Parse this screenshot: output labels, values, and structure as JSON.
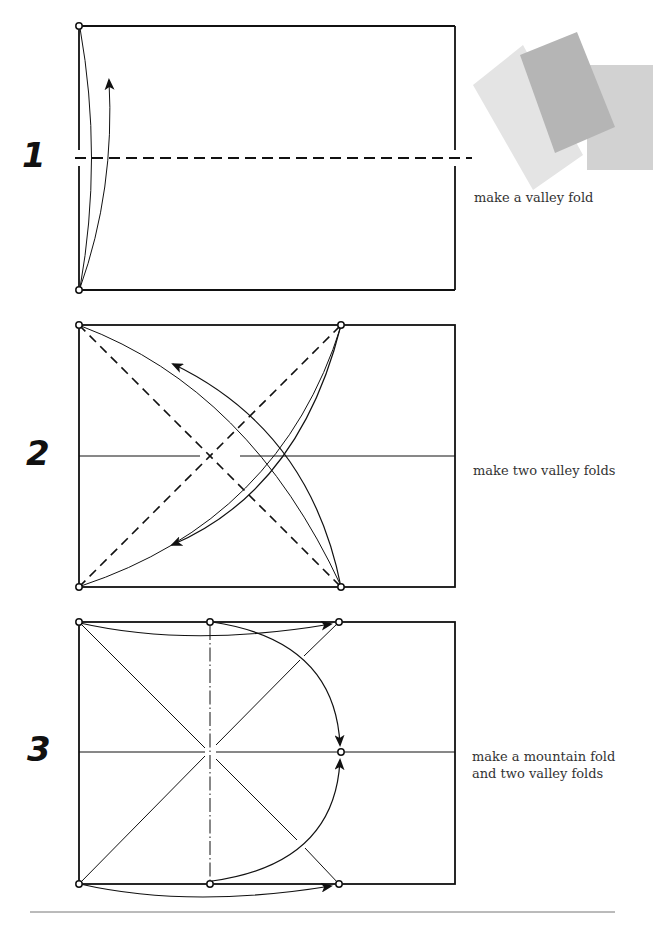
{
  "steps": [
    {
      "number": "1",
      "caption": "make a valley fold"
    },
    {
      "number": "2",
      "caption": "make two valley folds"
    },
    {
      "number": "3",
      "caption": "make a mountain fold\nand two valley folds"
    }
  ],
  "paper_swatches": {
    "colors": [
      "#e2e2e2",
      "#b8b8b8",
      "#d3d3d3"
    ]
  },
  "colors": {
    "line": "#111111",
    "paper_bg": "#ffffff"
  }
}
